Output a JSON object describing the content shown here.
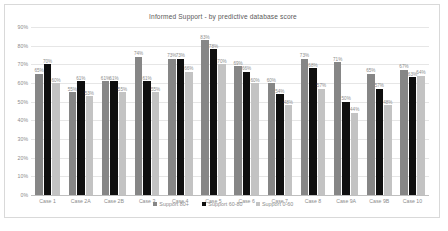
{
  "chart_data": {
    "type": "bar",
    "title": "Informed Support - by predictive database score",
    "xlabel": "",
    "ylabel": "",
    "ylim": [
      0,
      90
    ],
    "grid": true,
    "legend_position": "bottom",
    "ytick_labels": [
      "90%",
      "80%",
      "70%",
      "60%",
      "50%",
      "40%",
      "30%",
      "20%",
      "10%",
      "0%"
    ],
    "categories": [
      "Case 1",
      "Case 2A",
      "Case 2B",
      "Case 3",
      "Case 4",
      "Case 5",
      "Case 6",
      "Case 7",
      "Case 8",
      "Case 9A",
      "Case 9B",
      "Case 10"
    ],
    "series": [
      {
        "name": "Support 80+",
        "color": "#868686",
        "values": [
          65,
          55,
          61,
          74,
          73,
          83,
          69,
          60,
          73,
          71,
          65,
          67
        ],
        "labels": [
          "65%",
          "55%",
          "61%",
          "74%",
          "73%",
          "83%",
          "69%",
          "60%",
          "73%",
          "71%",
          "65%",
          "67%"
        ]
      },
      {
        "name": "Support 60-80",
        "color": "#0f0f0f",
        "values": [
          70,
          61,
          61,
          61,
          73,
          78,
          66,
          54,
          68,
          50,
          57,
          63
        ],
        "labels": [
          "70%",
          "61%",
          "61%",
          "61%",
          "73%",
          "78%",
          "66%",
          "54%",
          "68%",
          "50%",
          "57%",
          "63%"
        ]
      },
      {
        "name": "Support 0-60",
        "color": "#c3c3c3",
        "values": [
          60,
          53,
          55,
          55,
          66,
          70,
          60,
          48,
          57,
          44,
          48,
          64
        ],
        "labels": [
          "60%",
          "53%",
          "55%",
          "55%",
          "66%",
          "70%",
          "60%",
          "48%",
          "57%",
          "44%",
          "48%",
          "64%"
        ]
      }
    ]
  }
}
